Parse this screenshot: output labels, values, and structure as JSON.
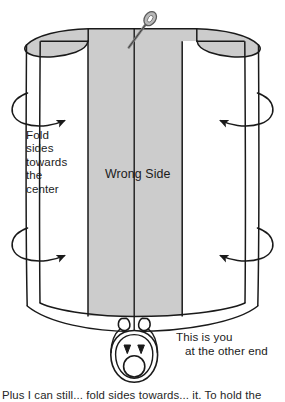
{
  "illustration": {
    "title": "Fold sides towards the center sewing diagram",
    "type": "line-drawing"
  },
  "labels": {
    "fold_instruction": "Fold\nsides\ntowards\nthe\ncenter",
    "wrong_side": "Wrong Side",
    "you_line1": "This is you",
    "you_line2": "at the other end"
  },
  "caption": {
    "text": "Plus I can still... fold sides towards... it. To hold the"
  },
  "icons": {
    "needle": "sewing-needle-icon",
    "person": "person-head-top-view-icon",
    "arrow_left_upper": "curved-wrap-arrow-right-icon",
    "arrow_left_lower": "curved-wrap-arrow-right-icon",
    "arrow_right_upper": "curved-wrap-arrow-left-icon",
    "arrow_right_lower": "curved-wrap-arrow-left-icon"
  },
  "colors": {
    "fabric_wrong_side": "#cccccc",
    "fabric_right_side": "#ffffff",
    "outline": "#1a1a1a",
    "needle": "#8a8a8a",
    "text": "#1b1b1b"
  },
  "geometry": {
    "center_panel_left": 88,
    "center_panel_right": 182,
    "center_seam_x": 134,
    "top_edge_y": 28,
    "bottom_edge_y": 330
  }
}
